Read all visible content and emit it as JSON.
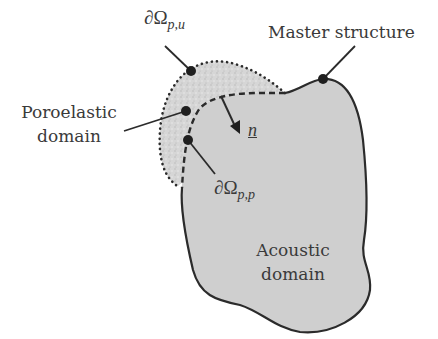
{
  "figure": {
    "labels": {
      "boundary_pu": {
        "symbol": "∂Ω",
        "subscript": "p,u"
      },
      "master_structure": "Master structure",
      "poroelastic_line1": "Poroelastic",
      "poroelastic_line2": "domain",
      "boundary_pp": {
        "symbol": "∂Ω",
        "subscript": "p,p"
      },
      "normal_vector": "n",
      "acoustic_line1": "Acoustic",
      "acoustic_line2": "domain"
    },
    "colors": {
      "acoustic_fill": "#cfcfcf",
      "poroelastic_fill": "#d8d8d8",
      "outline": "#2b2b2b",
      "text": "#3a3a3a"
    }
  }
}
